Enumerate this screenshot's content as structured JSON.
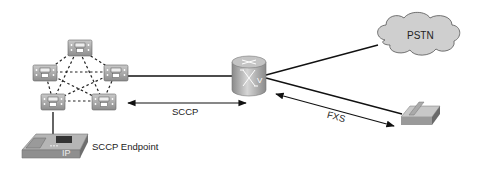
{
  "diagram": {
    "nodes": {
      "cluster": {
        "label": "",
        "type": "call-manager-cluster",
        "members": 5
      },
      "router": {
        "label": "",
        "type": "voice-gateway-router",
        "glyph": "V"
      },
      "pstn": {
        "label": "PSTN",
        "type": "cloud"
      },
      "ip_phone": {
        "label": "SCCP Endpoint",
        "type": "ip-phone",
        "glyph": "IP"
      },
      "analog_phone": {
        "label": "",
        "type": "analog-phone"
      }
    },
    "links": {
      "sccp": {
        "label": "SCCP"
      },
      "fxs": {
        "label": "FXS"
      }
    }
  }
}
